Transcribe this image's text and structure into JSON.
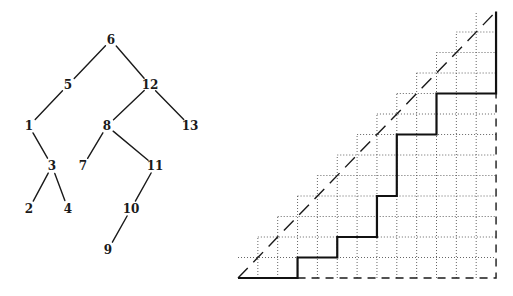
{
  "tree": {
    "nodes": [
      {
        "id": "6",
        "x": 111,
        "y": 40
      },
      {
        "id": "5",
        "x": 68,
        "y": 85
      },
      {
        "id": "12",
        "x": 150,
        "y": 85
      },
      {
        "id": "1",
        "x": 29,
        "y": 126
      },
      {
        "id": "8",
        "x": 107,
        "y": 126
      },
      {
        "id": "13",
        "x": 190,
        "y": 126
      },
      {
        "id": "3",
        "x": 52,
        "y": 166
      },
      {
        "id": "7",
        "x": 83,
        "y": 166
      },
      {
        "id": "11",
        "x": 155,
        "y": 166
      },
      {
        "id": "2",
        "x": 29,
        "y": 209
      },
      {
        "id": "4",
        "x": 68,
        "y": 209
      },
      {
        "id": "10",
        "x": 131,
        "y": 209
      },
      {
        "id": "9",
        "x": 108,
        "y": 250
      }
    ],
    "edges": [
      [
        "6",
        "5"
      ],
      [
        "6",
        "12"
      ],
      [
        "5",
        "1"
      ],
      [
        "12",
        "8"
      ],
      [
        "12",
        "13"
      ],
      [
        "1",
        "3"
      ],
      [
        "8",
        "7"
      ],
      [
        "8",
        "11"
      ],
      [
        "3",
        "2"
      ],
      [
        "3",
        "4"
      ],
      [
        "11",
        "10"
      ],
      [
        "10",
        "9"
      ]
    ]
  },
  "lattice": {
    "origin": {
      "x": 238,
      "y": 278
    },
    "size": 13,
    "cell_w": 19.85,
    "cell_h": 20.5,
    "path_steps": "EEEN EENEEN EENN ENNN EENN EEENNNN",
    "path_points": [
      [
        0,
        0
      ],
      [
        3,
        0
      ],
      [
        3,
        1
      ],
      [
        5,
        1
      ],
      [
        5,
        2
      ],
      [
        7,
        2
      ],
      [
        7,
        4
      ],
      [
        8,
        4
      ],
      [
        8,
        7
      ],
      [
        10,
        7
      ],
      [
        10,
        9
      ],
      [
        13,
        9
      ],
      [
        13,
        13
      ]
    ]
  },
  "colors": {
    "ink": "#1a1a1a",
    "grid": "#555555",
    "background": "#ffffff"
  }
}
